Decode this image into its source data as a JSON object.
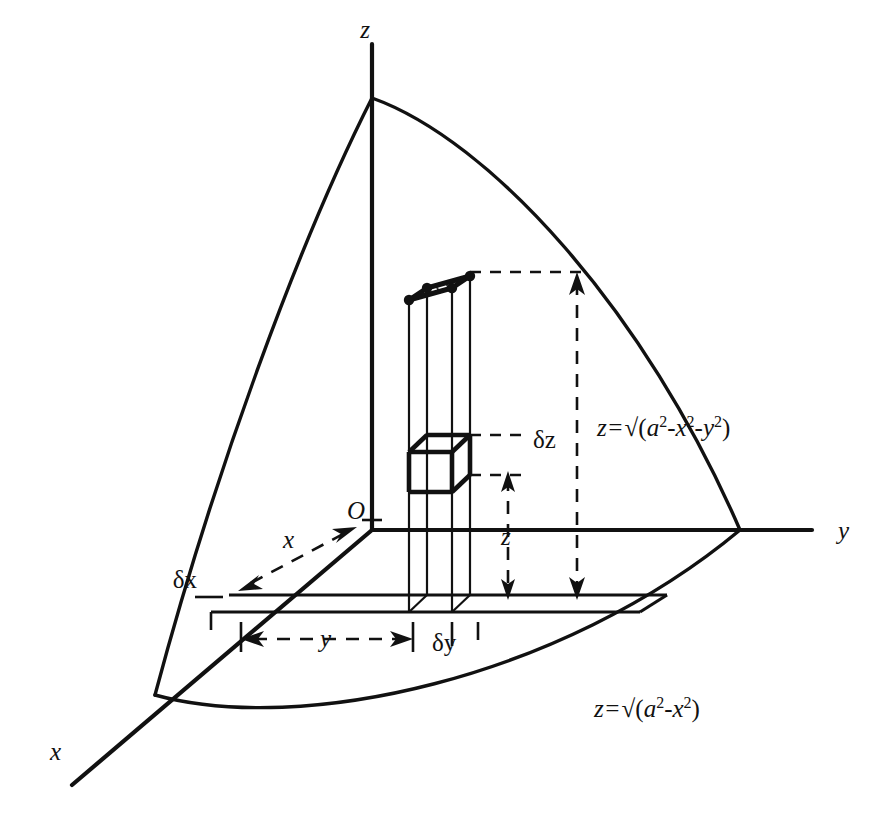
{
  "figure": {
    "background_color": "#ffffff",
    "line_color": "#111111"
  },
  "axes": {
    "z_label": "z",
    "y_label": "y",
    "x_label": "x",
    "origin_label": "O"
  },
  "dimensions": {
    "x_label": "x",
    "y_label": "y",
    "z_label": "z",
    "delta_x_label": "δx",
    "delta_y_label": "δy",
    "delta_z_label": "δz"
  },
  "formulas": {
    "sphere_surface": {
      "lhs": "z=",
      "radical": "√",
      "open": "(",
      "term_a": "a",
      "sup_a": "2",
      "minus1": "-",
      "term_x": "x",
      "sup_x": "2",
      "minus2": "-",
      "term_y": "y",
      "sup_y": "2",
      "close": ")",
      "plain": "z=√(a²-x²-y²)"
    },
    "base_circle": {
      "lhs": "z=",
      "radical": "√",
      "open": "(",
      "term_a": "a",
      "sup_a": "2",
      "minus1": "-",
      "term_x": "x",
      "sup_x": "2",
      "close": ")",
      "plain": "z=√(a²-x²)"
    }
  },
  "elements": {
    "column_name": "vertical-prism-column",
    "cube_name": "volume-element-cube",
    "cap_name": "hatched-surface-patch"
  }
}
